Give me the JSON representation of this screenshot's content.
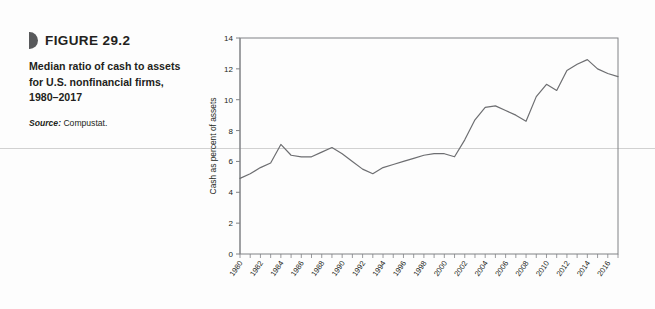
{
  "figure": {
    "marker_icon": "figure-wedge-icon",
    "number_label": "FIGURE 29.2",
    "title": "Median ratio of cash to assets for U.S. nonfinancial firms, 1980–2017",
    "source_label": "Source:",
    "source_value": "Compustat."
  },
  "colors": {
    "line": "#6d6e71",
    "axis": "#808285",
    "marker": "#58595b",
    "text": "#231f20",
    "page_rule": "#c9c9c9",
    "background": "#fdfdfd"
  },
  "chart_data": {
    "type": "line",
    "title": "",
    "xlabel": "",
    "ylabel": "Cash as percent of assets",
    "ylim": [
      0,
      14
    ],
    "yticks": [
      0,
      2,
      4,
      6,
      8,
      10,
      12,
      14
    ],
    "ytick_labels": [
      "0",
      "2",
      "4",
      "6",
      "8",
      "10",
      "12",
      "14"
    ],
    "xlim": [
      1980,
      2017
    ],
    "xticks": [
      1980,
      1981,
      1982,
      1983,
      1984,
      1985,
      1986,
      1987,
      1988,
      1989,
      1990,
      1991,
      1992,
      1993,
      1994,
      1995,
      1996,
      1997,
      1998,
      1999,
      2000,
      2001,
      2002,
      2003,
      2004,
      2005,
      2006,
      2007,
      2008,
      2009,
      2010,
      2011,
      2012,
      2013,
      2014,
      2015,
      2016,
      2017
    ],
    "xtick_labels": [
      "1980",
      "1982",
      "1984",
      "1986",
      "1988",
      "1990",
      "1992",
      "1994",
      "1996",
      "1998",
      "2000",
      "2002",
      "2004",
      "2006",
      "2008",
      "2010",
      "2012",
      "2014",
      "2016"
    ],
    "xtick_label_years": [
      1980,
      1982,
      1984,
      1986,
      1988,
      1990,
      1992,
      1994,
      1996,
      1998,
      2000,
      2002,
      2004,
      2006,
      2008,
      2010,
      2012,
      2014,
      2016
    ],
    "grid": false,
    "legend": "none",
    "x": [
      1980,
      1981,
      1982,
      1983,
      1984,
      1985,
      1986,
      1987,
      1988,
      1989,
      1990,
      1991,
      1992,
      1993,
      1994,
      1995,
      1996,
      1997,
      1998,
      1999,
      2000,
      2001,
      2002,
      2003,
      2004,
      2005,
      2006,
      2007,
      2008,
      2009,
      2010,
      2011,
      2012,
      2013,
      2014,
      2015,
      2016,
      2017
    ],
    "series": [
      {
        "name": "Median ratio of cash to assets",
        "values": [
          4.9,
          5.2,
          5.6,
          5.9,
          7.1,
          6.4,
          6.3,
          6.3,
          6.6,
          6.9,
          6.5,
          6.0,
          5.5,
          5.2,
          5.6,
          5.8,
          6.0,
          6.2,
          6.4,
          6.5,
          6.5,
          6.3,
          7.4,
          8.7,
          9.5,
          9.6,
          9.3,
          9.0,
          8.6,
          10.2,
          11.0,
          10.6,
          11.9,
          12.3,
          12.6,
          12.0,
          11.7,
          11.5
        ]
      }
    ]
  }
}
